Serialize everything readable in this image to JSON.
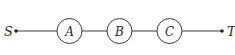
{
  "diagram": {
    "type": "series-network",
    "colors": {
      "stroke": "#3a3a3a",
      "text": "#2a2a2a",
      "background": "#ffffff"
    },
    "terminals": {
      "source": {
        "label": "S",
        "x": 16,
        "y": 31
      },
      "sink": {
        "label": "T",
        "x": 222,
        "y": 31
      }
    },
    "nodes": [
      {
        "id": "A",
        "label": "A",
        "cx": 69.5,
        "cy": 31,
        "r": 12.5
      },
      {
        "id": "B",
        "label": "B",
        "cx": 119.5,
        "cy": 31,
        "r": 12.5
      },
      {
        "id": "C",
        "label": "C",
        "cx": 169.5,
        "cy": 31,
        "r": 12.5
      }
    ],
    "edges": [
      {
        "from": "S",
        "to": "A"
      },
      {
        "from": "A",
        "to": "B"
      },
      {
        "from": "B",
        "to": "C"
      },
      {
        "from": "C",
        "to": "T"
      }
    ]
  }
}
